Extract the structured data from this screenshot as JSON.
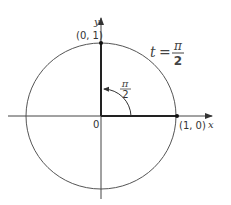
{
  "diagram": {
    "axes": {
      "x_label": "x",
      "y_label": "y",
      "origin_label": "0"
    },
    "points": [
      {
        "label": "(0, 1)",
        "x": 0,
        "y": 1
      },
      {
        "label": "(1, 0)",
        "x": 1,
        "y": 0
      }
    ],
    "angle_label": {
      "numerator": "π",
      "denominator": "2"
    },
    "t_equation": {
      "lhs": "t",
      "eq": "=",
      "numerator": "π",
      "denominator": "2"
    },
    "colors": {
      "line": "#444444",
      "text": "#333333",
      "background": "#ffffff"
    }
  }
}
